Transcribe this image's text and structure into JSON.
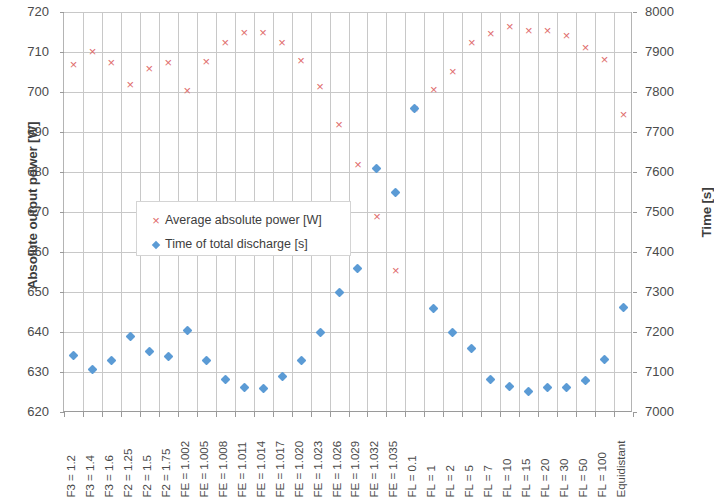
{
  "chart_data": {
    "type": "scatter",
    "title": "",
    "xlabel": "",
    "ylabel": "Absolute output power [W]",
    "y2label": "Time [s]",
    "ylim": [
      620,
      720
    ],
    "y2lim": [
      7000,
      8000
    ],
    "yticks": [
      720,
      710,
      700,
      690,
      680,
      670,
      660,
      650,
      640,
      630,
      620
    ],
    "y2ticks": [
      8000,
      7900,
      7800,
      7700,
      7600,
      7500,
      7400,
      7300,
      7200,
      7100,
      7000
    ],
    "grid": true,
    "legend_position": "inside-left",
    "categories": [
      "F3 = 1.2",
      "F3 = 1.4",
      "F3 = 1.6",
      "F2 = 1.25",
      "F2 = 1.5",
      "F2 = 1.75",
      "FE = 1.002",
      "FE = 1.005",
      "FE = 1.008",
      "FE = 1.011",
      "FE = 1.014",
      "FE = 1.017",
      "FE = 1.020",
      "FE = 1.023",
      "FE = 1.026",
      "FE = 1.029",
      "FE = 1.032",
      "FE = 1.035",
      "FL = 0.1",
      "FL = 1",
      "FL = 2",
      "FL = 5",
      "FL = 7",
      "FL = 10",
      "FL = 15",
      "FL = 20",
      "FL = 30",
      "FL = 50",
      "FL = 100",
      "Equidistant"
    ],
    "series": [
      {
        "name": "Average absolute power [W]",
        "axis": "left",
        "marker": "x",
        "color": "#e06c6c",
        "values": [
          706.8,
          710.2,
          707.4,
          702.0,
          706.0,
          707.4,
          700.4,
          707.7,
          712.3,
          714.8,
          715.0,
          712.3,
          708.0,
          701.4,
          691.9,
          681.8,
          668.8,
          655.5,
          695.8,
          700.7,
          705.2,
          712.5,
          714.6,
          716.3,
          715.5,
          715.5,
          714.2,
          711.2,
          708.2,
          694.5
        ]
      },
      {
        "name": "Time of total discharge [s]",
        "axis": "right",
        "marker": "diamond",
        "color": "#5b9bd5",
        "values": [
          7142,
          7107,
          7128,
          7190,
          7152,
          7138,
          7205,
          7130,
          7081,
          7062,
          7058,
          7090,
          7130,
          7200,
          7300,
          7360,
          7610,
          7550,
          7760,
          7260,
          7200,
          7160,
          7081,
          7063,
          7052,
          7061,
          7062,
          7080,
          7132,
          7262
        ]
      }
    ]
  },
  "legend": {
    "items": [
      {
        "label": "Average absolute power [W]",
        "key": "x-marker"
      },
      {
        "label": "Time of total discharge [s]",
        "key": "diamond-marker"
      }
    ]
  }
}
